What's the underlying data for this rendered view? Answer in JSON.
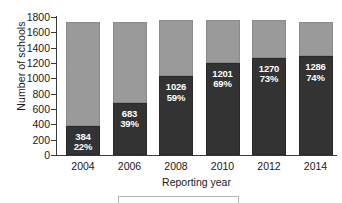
{
  "chart_data": {
    "type": "bar",
    "subtype": "stacked-bar",
    "title": "",
    "xlabel": "Reporting year",
    "ylabel": "Number of schools",
    "categories": [
      "2004",
      "2006",
      "2008",
      "2010",
      "2012",
      "2014"
    ],
    "ylim": [
      0,
      1800
    ],
    "ytick_values": [
      0,
      200,
      400,
      600,
      800,
      1000,
      1200,
      1400,
      1600,
      1800
    ],
    "ytick_labels": [
      "0",
      "200",
      "400",
      "600",
      "800",
      "1000",
      "1200",
      "1400",
      "1600",
      "1800"
    ],
    "grid": false,
    "legend_position": "bottom",
    "series": [
      {
        "name": "dark-segment",
        "color": "#333333",
        "values": [
          384,
          683,
          1026,
          1201,
          1270,
          1286
        ],
        "percent_labels": [
          "22%",
          "39%",
          "59%",
          "69%",
          "73%",
          "74%"
        ],
        "value_labels": [
          "384",
          "683",
          "1026",
          "1201",
          "1270",
          "1286"
        ]
      },
      {
        "name": "light-segment",
        "color": "#9a9a9a",
        "values": [
          1356,
          1057,
          734,
          559,
          495,
          454
        ]
      }
    ],
    "totals": [
      1740,
      1740,
      1760,
      1760,
      1765,
      1740
    ]
  },
  "axis": {
    "y_title": "Number of schools",
    "x_title": "Reporting year"
  }
}
